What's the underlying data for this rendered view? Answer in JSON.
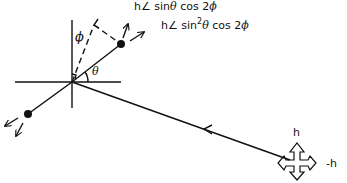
{
  "diagram": {
    "labels": {
      "phi": "ϕ",
      "theta": "θ",
      "eq1": {
        "prefix": "h∠ sin",
        "theta": "θ",
        "suffix": " cos 2",
        "phi": "ϕ"
      },
      "eq2": {
        "prefix": "h∠ sin",
        "exp": "2",
        "theta": "θ",
        "suffix": " cos 2",
        "phi": "ϕ"
      },
      "wave_up": "h",
      "wave_right": "-h"
    },
    "colors": {
      "stroke": "#111111",
      "background": "#ffffff"
    }
  }
}
